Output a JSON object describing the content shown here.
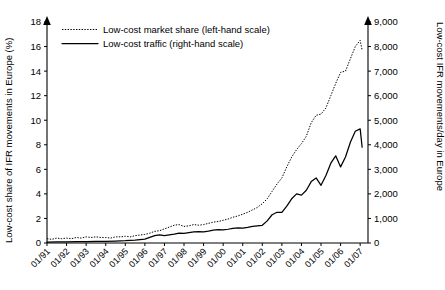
{
  "chart_data": {
    "type": "line",
    "title": "",
    "xlabel": "",
    "ylabel": "Low-cost share of IFR movements in Europe (%)",
    "y2label": "Low-cost IFR movements/day in Europe",
    "grid": false,
    "legend_position": "top-left",
    "ylim": [
      0,
      18
    ],
    "y2lim": [
      0,
      9000
    ],
    "yticks": [
      "0",
      "2",
      "4",
      "6",
      "8",
      "10",
      "12",
      "14",
      "16",
      "18"
    ],
    "ytick_values": [
      0,
      2,
      4,
      6,
      8,
      10,
      12,
      14,
      16,
      18
    ],
    "y2ticks": [
      "0",
      "1,000",
      "2,000",
      "3,000",
      "4,000",
      "5,000",
      "6,000",
      "7,000",
      "8,000",
      "9,000"
    ],
    "y2tick_values": [
      0,
      1000,
      2000,
      3000,
      4000,
      5000,
      6000,
      7000,
      8000,
      9000
    ],
    "xticks": [
      "01/91",
      "01/92",
      "01/93",
      "01/94",
      "01/95",
      "01/96",
      "01/97",
      "01/98",
      "01/99",
      "01/00",
      "01/01",
      "01/02",
      "01/03",
      "01/04",
      "01/05",
      "01/06",
      "01/07"
    ],
    "xtick_values": [
      1991,
      1992,
      1993,
      1994,
      1995,
      1996,
      1997,
      1998,
      1999,
      2000,
      2001,
      2002,
      2003,
      2004,
      2005,
      2006,
      2007
    ],
    "xlim": [
      1991,
      2007.4
    ],
    "series": [
      {
        "name": "Low-cost market share (left-hand scale)",
        "axis": "left",
        "style": "dotted",
        "units": "%",
        "x": [
          1991.0,
          1991.25,
          1991.5,
          1991.75,
          1992.0,
          1992.25,
          1992.5,
          1992.75,
          1993.0,
          1993.25,
          1993.5,
          1993.75,
          1994.0,
          1994.25,
          1994.5,
          1994.75,
          1995.0,
          1995.25,
          1995.5,
          1995.75,
          1996.0,
          1996.25,
          1996.5,
          1996.75,
          1997.0,
          1997.25,
          1997.5,
          1997.75,
          1998.0,
          1998.25,
          1998.5,
          1998.75,
          1999.0,
          1999.25,
          1999.5,
          1999.75,
          2000.0,
          2000.25,
          2000.5,
          2000.75,
          2001.0,
          2001.25,
          2001.5,
          2001.75,
          2002.0,
          2002.25,
          2002.5,
          2002.75,
          2003.0,
          2003.25,
          2003.5,
          2003.75,
          2004.0,
          2004.25,
          2004.5,
          2004.75,
          2005.0,
          2005.25,
          2005.5,
          2005.75,
          2006.0,
          2006.25,
          2006.5,
          2006.75,
          2007.0,
          2007.1
        ],
        "values": [
          0.35,
          0.3,
          0.4,
          0.35,
          0.4,
          0.35,
          0.45,
          0.4,
          0.5,
          0.45,
          0.5,
          0.45,
          0.45,
          0.4,
          0.5,
          0.5,
          0.55,
          0.5,
          0.6,
          0.65,
          0.7,
          0.8,
          0.95,
          1.0,
          1.15,
          1.3,
          1.45,
          1.5,
          1.35,
          1.4,
          1.5,
          1.45,
          1.5,
          1.6,
          1.7,
          1.75,
          1.85,
          1.95,
          2.1,
          2.2,
          2.35,
          2.5,
          2.7,
          2.9,
          3.2,
          3.6,
          4.2,
          4.8,
          5.3,
          6.2,
          7.0,
          7.6,
          8.1,
          8.7,
          9.8,
          10.4,
          10.5,
          11.0,
          12.0,
          13.0,
          13.9,
          14.0,
          15.0,
          16.0,
          16.5,
          15.7
        ]
      },
      {
        "name": "Low-cost traffic (right-hand scale)",
        "axis": "right",
        "style": "solid",
        "units": "IFR movements/day",
        "x": [
          1991.0,
          1991.5,
          1992.0,
          1992.5,
          1993.0,
          1993.5,
          1994.0,
          1994.5,
          1995.0,
          1995.5,
          1996.0,
          1996.25,
          1996.5,
          1996.75,
          1997.0,
          1997.25,
          1997.5,
          1997.75,
          1998.0,
          1998.25,
          1998.5,
          1998.75,
          1999.0,
          1999.25,
          1999.5,
          1999.75,
          2000.0,
          2000.25,
          2000.5,
          2000.75,
          2001.0,
          2001.25,
          2001.5,
          2001.75,
          2002.0,
          2002.25,
          2002.5,
          2002.75,
          2003.0,
          2003.25,
          2003.5,
          2003.75,
          2004.0,
          2004.25,
          2004.5,
          2004.75,
          2005.0,
          2005.25,
          2005.5,
          2005.75,
          2006.0,
          2006.25,
          2006.5,
          2006.75,
          2007.0,
          2007.1
        ],
        "values": [
          40,
          45,
          50,
          55,
          60,
          65,
          70,
          80,
          95,
          120,
          160,
          230,
          300,
          330,
          300,
          330,
          360,
          400,
          390,
          420,
          450,
          460,
          450,
          480,
          520,
          540,
          530,
          560,
          600,
          620,
          610,
          640,
          680,
          700,
          720,
          900,
          1150,
          1250,
          1250,
          1500,
          1800,
          2000,
          1950,
          2150,
          2500,
          2650,
          2350,
          2750,
          3250,
          3550,
          3100,
          3500,
          4100,
          4550,
          4650,
          3900
        ]
      }
    ],
    "annotations": []
  },
  "legend": {
    "entries": [
      {
        "label": "Low-cost market share (left-hand scale)",
        "style": "dotted"
      },
      {
        "label": "Low-cost traffic (right-hand scale)",
        "style": "solid"
      }
    ]
  },
  "colors": {
    "ink": "#000000",
    "background": "#ffffff"
  }
}
